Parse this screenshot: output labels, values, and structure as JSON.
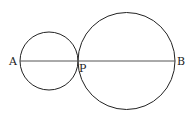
{
  "diagram": {
    "type": "geometry",
    "points": [
      {
        "label": "A",
        "x": 20,
        "y": 61
      },
      {
        "label": "P",
        "x": 78,
        "y": 61
      },
      {
        "label": "B",
        "x": 175,
        "y": 61
      }
    ],
    "circles": [
      {
        "name": "small-circle",
        "cx": 49,
        "cy": 61,
        "r": 29
      },
      {
        "name": "large-circle",
        "cx": 126.5,
        "cy": 61,
        "r": 48.5
      }
    ],
    "segment": {
      "from": "A",
      "to": "B"
    },
    "labels": {
      "a": "A",
      "p": "P",
      "b": "B"
    },
    "colors": {
      "stroke": "#222222",
      "line": "#555555"
    }
  }
}
